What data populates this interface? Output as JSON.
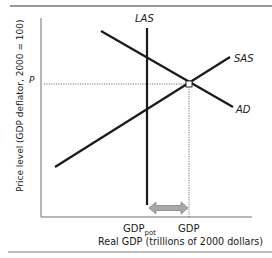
{
  "diagram": {
    "type": "aggregate-supply-demand",
    "curves": {
      "las": {
        "label": "LAS",
        "x": 147,
        "y1": 28,
        "y2": 205
      },
      "sas": {
        "label": "SAS",
        "from": [
          55,
          167
        ],
        "to": [
          230,
          57
        ]
      },
      "ad": {
        "label": "AD",
        "from": [
          101,
          31
        ],
        "to": [
          233,
          107
        ]
      }
    },
    "equilibrium": {
      "x": 189,
      "y": 84
    },
    "price_label": "P",
    "x_tick_labels": {
      "potential": {
        "main": "GDP",
        "sub": "pot"
      },
      "actual": "GDP"
    },
    "x_axis_label": "Real GDP (trillions of 2000 dollars)",
    "y_axis_label": "Price level (GDP deflator, 2000 = 100)",
    "gap_arrow": {
      "x1": 149,
      "x2": 188,
      "y": 208,
      "fill": "#a8a8a8"
    },
    "colors": {
      "curve": "#1a1a1a",
      "axis": "#6e6e6e",
      "dotted": "#555555",
      "rule": "#333333",
      "bottom_bar": "#bdbdbd"
    }
  }
}
